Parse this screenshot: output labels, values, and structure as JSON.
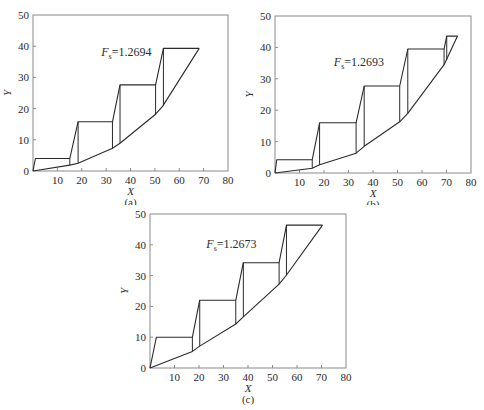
{
  "chart_data": [
    {
      "id": "a",
      "type": "line",
      "caption": "(a)",
      "title": "",
      "annotation": {
        "symbol": "F",
        "subscript": "s",
        "value": "=1.2694",
        "x": 28,
        "y": 37
      },
      "xlabel": "X",
      "ylabel": "Y",
      "xlim": [
        0,
        80
      ],
      "ylim": [
        0,
        50
      ],
      "xticks": [
        10,
        20,
        30,
        40,
        50,
        60,
        70,
        80
      ],
      "yticks": [
        0,
        10,
        20,
        30,
        40,
        50
      ],
      "x_origin_label": "",
      "grid": false,
      "legend": "none",
      "series": [
        {
          "name": "slip-surface",
          "points": [
            [
              0,
              0
            ],
            [
              15.1,
              1.9
            ],
            [
              18.5,
              2.5
            ],
            [
              32.6,
              7.3
            ],
            [
              35.7,
              8.9
            ],
            [
              50.3,
              18.2
            ],
            [
              53.2,
              20.8
            ],
            [
              68.2,
              39.3
            ]
          ]
        },
        {
          "name": "slice-tops",
          "points": [
            [
              0,
              0
            ],
            [
              1,
              4
            ],
            [
              15.1,
              4
            ],
            [
              18.5,
              15.8
            ],
            [
              32.6,
              15.8
            ],
            [
              35.7,
              27.6
            ],
            [
              50.3,
              27.6
            ],
            [
              53.5,
              39.3
            ],
            [
              68.2,
              39.3
            ]
          ]
        },
        {
          "name": "slice-boundaries",
          "segments": [
            [
              [
                15.1,
                1.9
              ],
              [
                15.1,
                4
              ]
            ],
            [
              [
                18.5,
                2.5
              ],
              [
                18.5,
                15.8
              ]
            ],
            [
              [
                32.6,
                7.3
              ],
              [
                32.6,
                15.8
              ]
            ],
            [
              [
                35.7,
                8.9
              ],
              [
                35.7,
                27.6
              ]
            ],
            [
              [
                50.3,
                18.2
              ],
              [
                50.3,
                27.6
              ]
            ],
            [
              [
                53.5,
                20.9
              ],
              [
                53.5,
                39.3
              ]
            ]
          ]
        }
      ]
    },
    {
      "id": "b",
      "type": "line",
      "caption": "(b)",
      "title": "",
      "annotation": {
        "symbol": "F",
        "subscript": "s",
        "value": "=1.2693",
        "x": 24,
        "y": 34
      },
      "xlabel": "X",
      "ylabel": "Y",
      "xlim": [
        0,
        80
      ],
      "ylim": [
        0,
        50
      ],
      "xticks": [
        10,
        20,
        30,
        40,
        50,
        60,
        70,
        80
      ],
      "yticks": [
        0,
        10,
        20,
        30,
        40,
        50
      ],
      "grid": false,
      "legend": "none",
      "series": [
        {
          "name": "slip-surface",
          "points": [
            [
              0,
              0
            ],
            [
              15.2,
              1.5
            ],
            [
              18.2,
              2.6
            ],
            [
              33.1,
              6.3
            ],
            [
              36.4,
              8.5
            ],
            [
              50.9,
              16.3
            ],
            [
              54.2,
              19
            ],
            [
              69,
              34.5
            ],
            [
              74.5,
              43.6
            ]
          ]
        },
        {
          "name": "slice-tops",
          "points": [
            [
              0,
              0
            ],
            [
              0.7,
              4.2
            ],
            [
              15.2,
              4.2
            ],
            [
              18.2,
              16
            ],
            [
              33.1,
              16
            ],
            [
              36.4,
              27.7
            ],
            [
              50.9,
              27.7
            ],
            [
              54.2,
              39.5
            ],
            [
              69,
              39.5
            ],
            [
              70.1,
              43.6
            ],
            [
              74.5,
              43.6
            ]
          ]
        },
        {
          "name": "slice-boundaries",
          "segments": [
            [
              [
                15.2,
                1.5
              ],
              [
                15.2,
                4.2
              ]
            ],
            [
              [
                18.2,
                2.6
              ],
              [
                18.2,
                16
              ]
            ],
            [
              [
                33.1,
                6.3
              ],
              [
                33.1,
                16
              ]
            ],
            [
              [
                36.4,
                8.5
              ],
              [
                36.4,
                27.7
              ]
            ],
            [
              [
                50.9,
                16.3
              ],
              [
                50.9,
                27.7
              ]
            ],
            [
              [
                54.2,
                19
              ],
              [
                54.2,
                39.5
              ]
            ],
            [
              [
                69,
                34.5
              ],
              [
                69,
                39.5
              ]
            ],
            [
              [
                70.1,
                36
              ],
              [
                70.1,
                43.6
              ]
            ]
          ]
        }
      ]
    },
    {
      "id": "c",
      "type": "line",
      "caption": "(c)",
      "title": "",
      "annotation": {
        "symbol": "F",
        "subscript": "s",
        "value": "=1.2673",
        "x": 23,
        "y": 39
      },
      "xlabel": "X",
      "ylabel": "Y",
      "xlim": [
        0,
        80
      ],
      "ylim": [
        0,
        50
      ],
      "xticks": [
        10,
        20,
        30,
        40,
        50,
        60,
        70,
        80
      ],
      "yticks": [
        0,
        10,
        20,
        30,
        40,
        50
      ],
      "grid": false,
      "legend": "none",
      "series": [
        {
          "name": "slip-surface",
          "points": [
            [
              0,
              0
            ],
            [
              17.3,
              5.4
            ],
            [
              20.3,
              7.1
            ],
            [
              35,
              14.3
            ],
            [
              38.1,
              16.6
            ],
            [
              52.7,
              27.2
            ],
            [
              55.7,
              30.2
            ],
            [
              70.4,
              46.4
            ]
          ]
        },
        {
          "name": "slice-tops",
          "points": [
            [
              0,
              0
            ],
            [
              2.6,
              10
            ],
            [
              17.3,
              10
            ],
            [
              20.3,
              22
            ],
            [
              35,
              22
            ],
            [
              38.1,
              34.2
            ],
            [
              52.7,
              34.2
            ],
            [
              55.7,
              46.4
            ],
            [
              70.4,
              46.4
            ]
          ]
        },
        {
          "name": "slice-boundaries",
          "segments": [
            [
              [
                17.3,
                5.4
              ],
              [
                17.3,
                10
              ]
            ],
            [
              [
                20.3,
                7.1
              ],
              [
                20.3,
                22
              ]
            ],
            [
              [
                35,
                14.3
              ],
              [
                35,
                22
              ]
            ],
            [
              [
                38.1,
                16.6
              ],
              [
                38.1,
                34.2
              ]
            ],
            [
              [
                52.7,
                27.2
              ],
              [
                52.7,
                34.2
              ]
            ],
            [
              [
                55.7,
                30.2
              ],
              [
                55.7,
                46.4
              ]
            ]
          ]
        }
      ]
    }
  ],
  "panels": {
    "a": {
      "caption": "(a)",
      "fs_label": "=1.2694",
      "xlabel": "X",
      "ylabel": "Y"
    },
    "b": {
      "caption": "(b)",
      "fs_label": "=1.2693",
      "xlabel": "X",
      "ylabel": "Y"
    },
    "c": {
      "caption": "(c)",
      "fs_label": "=1.2673",
      "xlabel": "X",
      "ylabel": "Y"
    }
  },
  "colors": {
    "line": "#2a2a2a",
    "axis": "#8a8a8a",
    "background": "#ffffff"
  }
}
